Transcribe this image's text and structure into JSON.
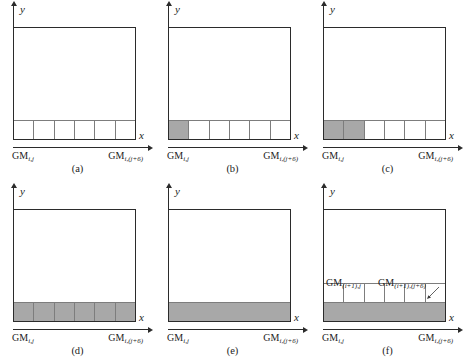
{
  "figure": {
    "type": "grid-fill-sequence-diagram",
    "panel_count": 6,
    "cells_per_row": 6,
    "colors": {
      "fill": "#a8a8a8",
      "outline": "#2b2b2b",
      "cell_divider": "#7d7d7d",
      "background": "#ffffff"
    },
    "axes": {
      "x_label": "x",
      "y_label": "y"
    },
    "labels": {
      "gm_prefix": "GM",
      "sub_ij": "i,j",
      "sub_ij6": "i,(j+6)",
      "sub_i1j": "(i+1),j",
      "sub_i1j6": "(i+1),(j+6)"
    },
    "panels": [
      {
        "id": "a",
        "caption": "(a)",
        "left_label_prefix": "GM",
        "left_label_sub": "i,j",
        "right_label_prefix": "GM",
        "right_label_sub": "i,(j+6)",
        "rows": [
          {
            "style": "cells",
            "cells": 6,
            "filled": 0
          }
        ],
        "inner_labels": []
      },
      {
        "id": "b",
        "caption": "(b)",
        "left_label_prefix": "GM",
        "left_label_sub": "i,j",
        "right_label_prefix": "GM",
        "right_label_sub": "i,(j+6)",
        "rows": [
          {
            "style": "cells",
            "cells": 6,
            "filled": 1
          }
        ],
        "inner_labels": []
      },
      {
        "id": "c",
        "caption": "(c)",
        "left_label_prefix": "GM",
        "left_label_sub": "i,j",
        "right_label_prefix": "GM",
        "right_label_sub": "i,(j+6)",
        "rows": [
          {
            "style": "cells",
            "cells": 6,
            "filled": 2
          }
        ],
        "inner_labels": []
      },
      {
        "id": "d",
        "caption": "(d)",
        "left_label_prefix": "GM",
        "left_label_sub": "i,j",
        "right_label_prefix": "GM",
        "right_label_sub": "i,(j+6)",
        "rows": [
          {
            "style": "cells",
            "cells": 6,
            "filled": 6
          }
        ],
        "inner_labels": []
      },
      {
        "id": "e",
        "caption": "(e)",
        "left_label_prefix": "GM",
        "left_label_sub": "i,j",
        "right_label_prefix": "GM",
        "right_label_sub": "i,(j+6)",
        "rows": [
          {
            "style": "solid",
            "cells": 0,
            "filled": 0
          }
        ],
        "inner_labels": []
      },
      {
        "id": "f",
        "caption": "(f)",
        "left_label_prefix": "GM",
        "left_label_sub": "i,j",
        "right_label_prefix": "GM",
        "right_label_sub": "i,(j+6)",
        "rows": [
          {
            "style": "solid",
            "cells": 0,
            "filled": 0
          },
          {
            "style": "cells",
            "cells": 6,
            "filled": 0
          }
        ],
        "inner_labels": [
          {
            "prefix": "GM",
            "sub": "(i+1),j",
            "position": "inner-left"
          },
          {
            "prefix": "GM",
            "sub": "(i+1),(j+6)",
            "position": "inner-right"
          }
        ]
      }
    ]
  }
}
